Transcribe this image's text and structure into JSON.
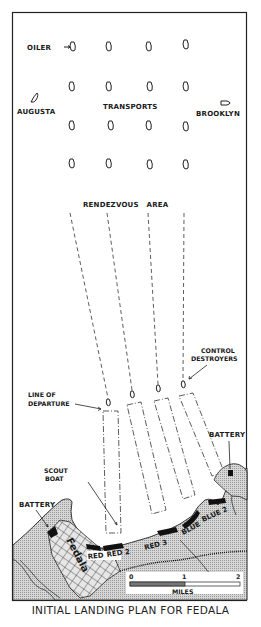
{
  "title": "INITIAL LANDING PLAN FOR FEDALA",
  "labels": {
    "oiler": "OILER",
    "augusta": "AUGUSTA",
    "transports": "TRANSPORTS",
    "brooklyn": "BROOKLYN",
    "rendezvous_area": "RENDEZVOUS   AREA",
    "control_destroyers_1": "CONTROL",
    "control_destroyers_2": "DESTROYERS",
    "line_of_departure_1": "LINE OF",
    "line_of_departure_2": "DEPARTURE",
    "battery_east": "BATTERY",
    "scout_boat_1": "SCOUT",
    "scout_boat_2": "BOAT",
    "battery_west": "BATTERY",
    "town": "Fedala"
  },
  "beaches": [
    "RED",
    "RED 2",
    "RED 3",
    "BLUE",
    "BLUE 2"
  ],
  "scale": {
    "ticks": [
      "0",
      "1",
      "2"
    ],
    "unit": "MILES"
  },
  "colors": {
    "ink": "#1a1a1a",
    "land": "#bdbdbd",
    "water": "#ffffff"
  }
}
